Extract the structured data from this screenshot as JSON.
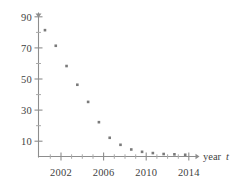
{
  "chart_data": {
    "type": "scatter",
    "title": "",
    "subtitle": "",
    "xlabel": "year t",
    "ylabel": "",
    "xlim": [
      2000.4,
      2015.0
    ],
    "ylim": [
      0,
      92
    ],
    "grid": false,
    "legend": null,
    "x_tick_labels": [
      "2002",
      "2006",
      "2010",
      "2014"
    ],
    "x_tick_values": [
      2002,
      2006,
      2010,
      2014
    ],
    "x_minor_ticks": [
      2001,
      2003,
      2004,
      2005,
      2007,
      2008,
      2009,
      2011,
      2012,
      2013
    ],
    "y_tick_labels": [
      "90",
      "70",
      "50",
      "30",
      "10"
    ],
    "y_tick_values": [
      90,
      70,
      50,
      30,
      10
    ],
    "y_minor_ticks": [
      80,
      60,
      40,
      20
    ],
    "x": [
      2001,
      2002,
      2003,
      2004,
      2005,
      2006,
      2007,
      2008,
      2009,
      2010,
      2011,
      2012,
      2013,
      2014
    ],
    "y": [
      81,
      71,
      58,
      46,
      35,
      22,
      12,
      7.5,
      4.5,
      3,
      2.2,
      1.6,
      1.4,
      1.1
    ],
    "points": [
      {
        "x": 2001,
        "y": 81
      },
      {
        "x": 2002,
        "y": 71
      },
      {
        "x": 2003,
        "y": 58
      },
      {
        "x": 2004,
        "y": 46
      },
      {
        "x": 2005,
        "y": 35
      },
      {
        "x": 2006,
        "y": 22
      },
      {
        "x": 2007,
        "y": 12
      },
      {
        "x": 2008,
        "y": 7.5
      },
      {
        "x": 2009,
        "y": 4.5
      },
      {
        "x": 2010,
        "y": 3
      },
      {
        "x": 2011,
        "y": 2.2
      },
      {
        "x": 2012,
        "y": 1.6
      },
      {
        "x": 2013,
        "y": 1.4
      },
      {
        "x": 2014,
        "y": 1.1
      }
    ],
    "marker": "square",
    "marker_color": "#7a7a7a",
    "axis_color": "#8d8d8d"
  },
  "labels": {
    "y_90": "90",
    "y_70": "70",
    "y_50": "50",
    "y_30": "30",
    "y_10": "10",
    "x_2002": "2002",
    "x_2006": "2006",
    "x_2010": "2010",
    "x_2014": "2014",
    "axis_title_word": "year",
    "axis_title_var": "t"
  }
}
